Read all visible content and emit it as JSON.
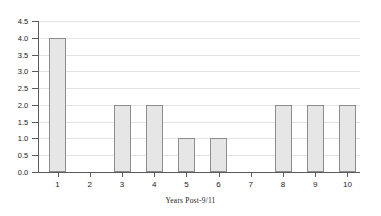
{
  "chart_data": {
    "type": "bar",
    "title": "",
    "subtitle": "",
    "xlabel": "Years Post-9/11",
    "ylabel": "",
    "categories": [
      "1",
      "2",
      "3",
      "4",
      "5",
      "6",
      "7",
      "8",
      "9",
      "10"
    ],
    "values": [
      4.0,
      0,
      2.0,
      2.0,
      1.0,
      1.0,
      0,
      2.0,
      2.0,
      2.0
    ],
    "ylim": [
      0.0,
      4.5
    ],
    "ytick_labels": [
      "0.0",
      "0.5",
      "1.0",
      "1.5",
      "2.0",
      "2.5",
      "3.0",
      "3.5",
      "4.0",
      "4.5"
    ],
    "ytick_values": [
      0.0,
      0.5,
      1.0,
      1.5,
      2.0,
      2.5,
      3.0,
      3.5,
      4.0,
      4.5
    ],
    "grid": true,
    "grid_axis": "y",
    "legend": null,
    "legend_position": "none",
    "bar_fill_color": "#e6e6e6",
    "bar_edge_color": "#8d8d8d",
    "grid_color": "#e3e3e3",
    "axis_color": "#5b5b5b",
    "background_color": "#ffffff",
    "text_color": "#1a1a1a"
  }
}
